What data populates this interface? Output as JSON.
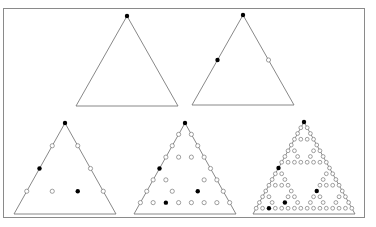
{
  "figure": {
    "colors": {
      "frame": "#8a8a8a",
      "edge": "#7a7a7a",
      "filled": "#000000",
      "open_stroke": "#777777",
      "open_fill": "#ffffff"
    },
    "panels": [
      {
        "id": "panel-1",
        "levels": 1,
        "apex": [
          127,
          16
        ],
        "base_y": 106,
        "half_width": 51,
        "filled": [
          [
            0,
            0
          ]
        ]
      },
      {
        "id": "panel-2",
        "levels": 2,
        "apex": [
          243,
          15
        ],
        "base_y": 105,
        "half_width": 51,
        "filled": [
          [
            0,
            0
          ],
          [
            1,
            0
          ]
        ]
      },
      {
        "id": "panel-3",
        "levels": 4,
        "apex": [
          65,
          123
        ],
        "base_y": 214,
        "half_width": 51,
        "filled": [
          [
            0,
            0
          ],
          [
            2,
            0
          ],
          [
            3,
            2
          ]
        ]
      },
      {
        "id": "panel-4",
        "levels": 8,
        "apex": [
          185,
          123
        ],
        "base_y": 214,
        "half_width": 51,
        "filled": [
          [
            0,
            0
          ],
          [
            4,
            0
          ],
          [
            6,
            4
          ],
          [
            7,
            2
          ]
        ]
      },
      {
        "id": "panel-5",
        "levels": 16,
        "apex": [
          304,
          122
        ],
        "base_y": 214,
        "half_width": 51,
        "filled": [
          [
            0,
            0
          ],
          [
            8,
            0
          ],
          [
            12,
            8
          ],
          [
            14,
            4
          ],
          [
            15,
            2
          ]
        ]
      }
    ]
  }
}
